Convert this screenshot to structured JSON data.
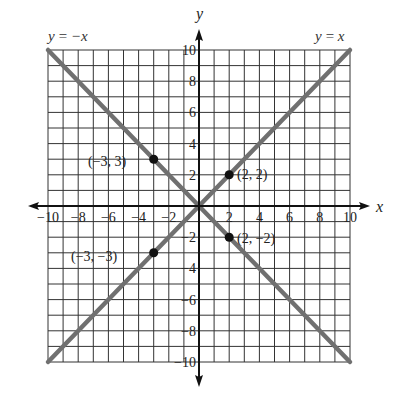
{
  "chart_data": {
    "type": "line",
    "title": "",
    "xlabel": "x",
    "ylabel": "y",
    "xlim": [
      -10,
      10
    ],
    "ylim": [
      -10,
      10
    ],
    "grid": true,
    "x_ticks": [
      -10,
      -8,
      -6,
      -4,
      -2,
      2,
      4,
      6,
      8,
      10
    ],
    "y_ticks": [
      10,
      8,
      6,
      4,
      2,
      -2,
      -4,
      -6,
      -8,
      -10
    ],
    "x_tick_labels": [
      "−10",
      "−8",
      "−6",
      "−4",
      "−2",
      "2",
      "4",
      "6",
      "8",
      "10"
    ],
    "y_tick_labels": [
      "10",
      "8",
      "6",
      "4",
      "2",
      "−2",
      "−4",
      "−6",
      "−8",
      "−10"
    ],
    "series": [
      {
        "name": "y = x",
        "label": "y = x",
        "points": [
          [
            -10,
            -10
          ],
          [
            10,
            10
          ]
        ],
        "color": "#707070"
      },
      {
        "name": "y = −x",
        "label": "y = −x",
        "points": [
          [
            -10,
            10
          ],
          [
            10,
            -10
          ]
        ],
        "color": "#707070"
      }
    ],
    "points": [
      {
        "x": -3,
        "y": 3,
        "label": "(−3, 3)"
      },
      {
        "x": 2,
        "y": 2,
        "label": "(2, 2)"
      },
      {
        "x": -3,
        "y": -3,
        "label": "(−3, −3)"
      },
      {
        "x": 2,
        "y": -2,
        "label": "(2, −2)"
      }
    ],
    "annotations": [
      "y = −x",
      "y = x"
    ]
  },
  "labels": {
    "x_axis": "x",
    "y_axis": "y",
    "line_neg": "y = −x",
    "line_pos": "y = x",
    "p1": "(−3, 3)",
    "p2": "(2, 2)",
    "p3": "(−3, −3)",
    "p4": "(2, −2)"
  },
  "colors": {
    "grid": "#333333",
    "line": "#707070",
    "axis": "#111111",
    "point": "#111111"
  }
}
